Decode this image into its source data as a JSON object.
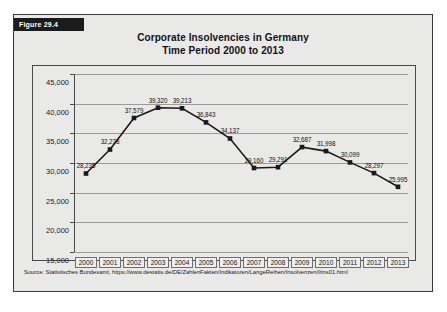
{
  "figure": {
    "tag": "Figure 29.4"
  },
  "chart_data": {
    "type": "line",
    "title": "Corporate Insolvencies in Germany",
    "subtitle": "Time Period 2000 to 2013",
    "xlabel": "",
    "ylabel": "",
    "categories": [
      "2000",
      "2001",
      "2002",
      "2003",
      "2004",
      "2005",
      "2006",
      "2007",
      "2008",
      "2009",
      "2010",
      "2011",
      "2012",
      "2013"
    ],
    "values": [
      28235,
      32278,
      37579,
      39320,
      39213,
      36843,
      34137,
      29160,
      29291,
      32687,
      31998,
      30099,
      28297,
      25995
    ],
    "point_labels": [
      "28,235",
      "32,278",
      "37,579",
      "39,320",
      "39,213",
      "36,843",
      "34,137",
      "29,160",
      "29,291",
      "32,687",
      "31,998",
      "30,099",
      "28,297",
      "25,995"
    ],
    "ylim": [
      15000,
      45000
    ],
    "yticks": [
      15000,
      20000,
      25000,
      30000,
      35000,
      40000,
      45000
    ],
    "ytick_labels": [
      "15,000",
      "20,000",
      "25,000",
      "30,000",
      "35,000",
      "40,000",
      "45,000"
    ],
    "grid": true,
    "legend": "none",
    "marker": "square",
    "line_color": "#1a1a1a",
    "grid_color": "#9a9a9a"
  },
  "source": {
    "text": "Source: Statistisches Bundesamt, https://www.destatis.de/DE/ZahlenFakten/Indikatoren/LangeReihen/Insolvenzen/lrins01.html"
  }
}
